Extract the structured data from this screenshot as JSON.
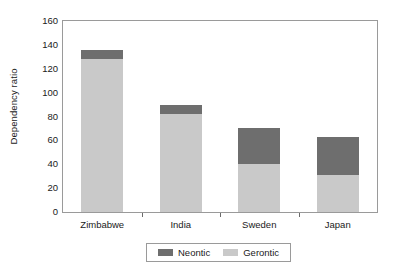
{
  "chart_data": {
    "type": "bar",
    "subtype": "stacked-vertical",
    "title": "",
    "xlabel": "",
    "ylabel": "Dependency ratio",
    "categories": [
      "Zimbabwe",
      "India",
      "Sweden",
      "Japan"
    ],
    "series": [
      {
        "name": "Neontic",
        "values": [
          8,
          8,
          30,
          32
        ],
        "color": "#6e6e6e"
      },
      {
        "name": "Gerontic",
        "values": [
          128,
          82,
          40,
          31
        ],
        "color": "#c9c9c9"
      }
    ],
    "stack_order_bottom_to_top": [
      "Gerontic",
      "Neontic"
    ],
    "totals": [
      136,
      90,
      70,
      63
    ],
    "ylim": [
      0,
      160
    ],
    "ytick_values": [
      0,
      20,
      40,
      60,
      80,
      100,
      120,
      140,
      160
    ],
    "ytick_labels": [
      "0",
      "20",
      "40",
      "60",
      "80",
      "100",
      "120",
      "140",
      "160"
    ],
    "grid": false,
    "legend_position": "bottom-center",
    "legend_entries": [
      "Neontic",
      "Gerontic"
    ],
    "frame": true
  },
  "axes": {
    "y_title": "Dependency ratio"
  },
  "legend": {
    "entries": [
      {
        "label": "Neontic",
        "color": "#6e6e6e"
      },
      {
        "label": "Gerontic",
        "color": "#c9c9c9"
      }
    ]
  },
  "colors": {
    "neontic": "#6e6e6e",
    "gerontic": "#c9c9c9",
    "frame": "#9a9a9a",
    "text": "#1a1a1a",
    "background": "#ffffff"
  }
}
